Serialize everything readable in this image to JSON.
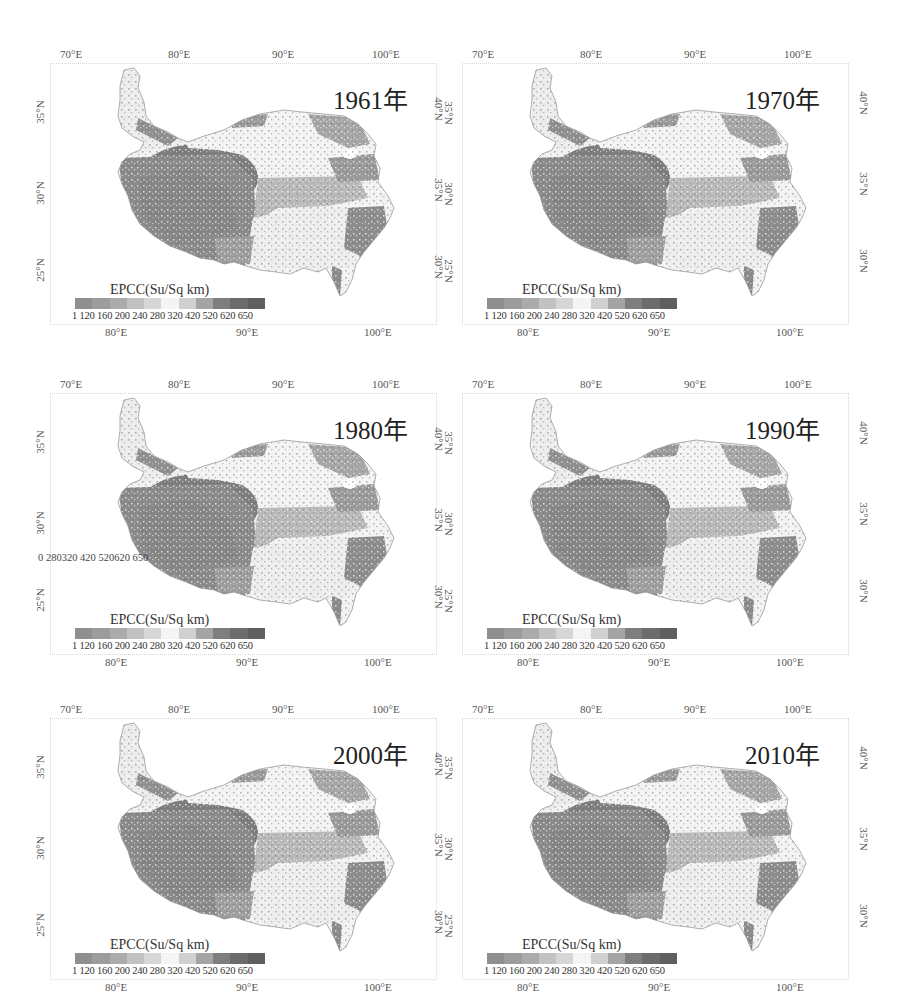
{
  "figure": {
    "legend_title": "EPCC(Su/Sq km)",
    "legend_labels": "1   120 160 200 240 280 320 420 520 620 650",
    "legend_breaks": [
      "1",
      "120",
      "160",
      "200",
      "240",
      "280",
      "320",
      "420",
      "520",
      "620",
      "650"
    ],
    "legend_colors": [
      "#8f8f8f",
      "#9c9c9c",
      "#ababab",
      "#c2c2c2",
      "#d6d6d6",
      "#f4f4f4",
      "#d0d0d0",
      "#a4a4a4",
      "#7e7e7e",
      "#6c6c6c",
      "#5f5f5f"
    ],
    "top_axis": [
      "70°E",
      "80°E",
      "90°E",
      "100°E"
    ],
    "bottom_axis": [
      "80°E",
      "90°E",
      "100°E"
    ],
    "left_axis": [
      "35°N",
      "30°N",
      "25°N"
    ],
    "right_axis_left_col": [
      {
        "a": "40°N",
        "b": "35°N"
      },
      {
        "a": "35°N",
        "b": "30°N"
      },
      {
        "a": "30°N",
        "b": "25°N"
      }
    ],
    "right_axis_right_col": [
      "40°N",
      "35°N",
      "30°N"
    ],
    "stray_label": "0 280320 420 520620 650"
  },
  "panels": [
    {
      "year": "1961年"
    },
    {
      "year": "1970年"
    },
    {
      "year": "1980年"
    },
    {
      "year": "1990年"
    },
    {
      "year": "2000年"
    },
    {
      "year": "2010年"
    }
  ],
  "chart_data": {
    "type": "heatmap",
    "panels": [
      "1961年",
      "1970年",
      "1980年",
      "1990年",
      "2000年",
      "2010年"
    ],
    "legend": {
      "title": "EPCC(Su/Sq km)",
      "breaks": [
        1,
        120,
        160,
        200,
        240,
        280,
        320,
        420,
        520,
        620,
        650
      ],
      "colormap": "grayscale diverging (dark low / white mid / dark high)"
    },
    "x_ticks_top": [
      "70°E",
      "80°E",
      "90°E",
      "100°E"
    ],
    "x_ticks_bottom": [
      "80°E",
      "90°E",
      "100°E"
    ],
    "y_ticks_left": [
      "35°N",
      "30°N",
      "25°N"
    ],
    "y_ticks_right": [
      "40°N",
      "35°N",
      "30°N"
    ],
    "layout": {
      "rows": 3,
      "cols": 2,
      "grid": false
    }
  }
}
